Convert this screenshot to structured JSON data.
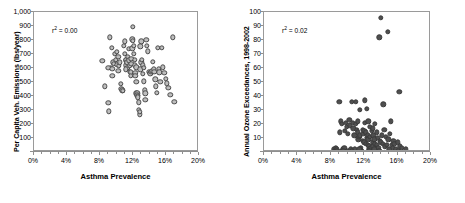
{
  "figure": {
    "background": "#ffffff",
    "frame_color": "#9a9a9a"
  },
  "chart_data": [
    {
      "type": "scatter",
      "panel": "left",
      "title": "",
      "xlabel": "Asthma Prevalence",
      "ylabel": "Per Capita Veh. Emissions (lbs/year)",
      "annotation": "r² = 0.00",
      "r_squared": 0.0,
      "marker_style": "open-circle",
      "marker_fill": "#bdbdbd",
      "marker_edge": "#4a4a4a",
      "grid": false,
      "legend": "none",
      "xlim": [
        0,
        20
      ],
      "ylim": [
        0,
        1000
      ],
      "xticks": [
        0,
        4,
        8,
        12,
        16,
        20
      ],
      "xticklabels": [
        "0%",
        "4%",
        "8%",
        "12%",
        "16%",
        "20%"
      ],
      "yticks": [
        100,
        200,
        300,
        400,
        500,
        600,
        700,
        800,
        900,
        1000
      ],
      "yticklabels": [
        "100",
        "200",
        "300",
        "400",
        "500",
        "600",
        "700",
        "800",
        "900",
        "1,000"
      ],
      "x": [
        8.3,
        8.6,
        9.0,
        9.1,
        9.2,
        9.3,
        9.4,
        9.5,
        9.6,
        9.7,
        9.8,
        9.9,
        10.0,
        10.1,
        10.2,
        10.3,
        10.4,
        10.5,
        10.6,
        10.7,
        10.8,
        10.9,
        11.0,
        11.0,
        11.1,
        11.2,
        11.2,
        11.3,
        11.3,
        11.4,
        11.5,
        11.5,
        11.6,
        11.6,
        11.7,
        11.7,
        11.8,
        11.8,
        11.9,
        11.9,
        12.0,
        12.0,
        12.1,
        12.1,
        12.2,
        12.2,
        12.3,
        12.3,
        12.4,
        12.4,
        12.5,
        12.5,
        12.6,
        12.6,
        12.7,
        12.7,
        12.8,
        12.8,
        12.9,
        13.0,
        13.0,
        13.1,
        13.2,
        13.2,
        13.3,
        13.4,
        13.5,
        13.5,
        13.6,
        13.7,
        13.8,
        13.9,
        14.0,
        14.1,
        14.2,
        14.3,
        14.4,
        14.5,
        14.6,
        14.7,
        14.8,
        14.9,
        15.0,
        15.1,
        15.2,
        15.3,
        15.5,
        15.6,
        15.8,
        16.0,
        16.1,
        16.3,
        16.5,
        16.8,
        17.0,
        9.0,
        9.5,
        10.2,
        11.1,
        12.4,
        12.9,
        13.3
      ],
      "y": [
        650,
        470,
        350,
        290,
        820,
        600,
        745,
        545,
        640,
        630,
        700,
        660,
        715,
        625,
        680,
        615,
        640,
        485,
        450,
        440,
        435,
        760,
        790,
        700,
        655,
        660,
        620,
        640,
        600,
        680,
        735,
        655,
        620,
        575,
        570,
        545,
        665,
        630,
        805,
        740,
        895,
        795,
        760,
        700,
        660,
        620,
        565,
        545,
        500,
        420,
        420,
        405,
        400,
        390,
        355,
        300,
        270,
        285,
        755,
        790,
        640,
        660,
        620,
        560,
        505,
        440,
        420,
        375,
        800,
        760,
        720,
        575,
        565,
        560,
        575,
        580,
        645,
        590,
        575,
        520,
        470,
        425,
        745,
        595,
        570,
        500,
        745,
        605,
        565,
        525,
        490,
        460,
        410,
        820,
        360,
        600,
        595,
        580,
        590,
        605,
        590,
        600
      ]
    },
    {
      "type": "scatter",
      "panel": "right",
      "title": "",
      "xlabel": "Asthma Prevalence",
      "ylabel": "Annual Ozone Exceedances, 1998-2002",
      "annotation": "r² = 0.02",
      "r_squared": 0.02,
      "marker_style": "filled-circle",
      "marker_fill": "#4f4f4f",
      "marker_edge": "#3a3a3a",
      "grid": false,
      "legend": "none",
      "xlim": [
        0,
        20
      ],
      "ylim": [
        0,
        100
      ],
      "xticks": [
        0,
        4,
        8,
        12,
        16,
        20
      ],
      "xticklabels": [
        "0%",
        "4%",
        "8%",
        "12%",
        "16%",
        "20%"
      ],
      "yticks": [
        10,
        20,
        30,
        40,
        50,
        60,
        70,
        80,
        90,
        100
      ],
      "yticklabels": [
        "10",
        "20",
        "30",
        "40",
        "50",
        "60",
        "70",
        "80",
        "90",
        "100"
      ],
      "x": [
        8.4,
        8.5,
        8.6,
        8.7,
        8.8,
        9.0,
        9.1,
        9.2,
        9.3,
        9.4,
        9.5,
        9.6,
        9.7,
        9.8,
        9.9,
        10.0,
        10.1,
        10.2,
        10.3,
        10.4,
        10.5,
        10.6,
        10.7,
        10.8,
        10.9,
        11.0,
        11.0,
        11.1,
        11.2,
        11.2,
        11.3,
        11.4,
        11.5,
        11.5,
        11.6,
        11.7,
        11.8,
        11.8,
        11.9,
        12.0,
        12.0,
        12.1,
        12.1,
        12.2,
        12.2,
        12.3,
        12.3,
        12.4,
        12.4,
        12.5,
        12.5,
        12.6,
        12.6,
        12.7,
        12.7,
        12.8,
        12.9,
        13.0,
        13.0,
        13.1,
        13.1,
        13.2,
        13.3,
        13.3,
        13.4,
        13.5,
        13.5,
        13.6,
        13.7,
        13.8,
        13.9,
        14.0,
        14.0,
        14.1,
        14.2,
        14.3,
        14.4,
        14.5,
        14.6,
        14.7,
        14.8,
        14.9,
        15.0,
        15.1,
        15.2,
        15.3,
        15.4,
        15.5,
        15.6,
        15.8,
        16.0,
        16.1,
        16.2,
        16.3,
        16.5,
        17.0,
        9.5,
        10.5,
        11.4,
        12.6,
        13.2,
        13.8
      ],
      "y": [
        2,
        1,
        3,
        2,
        1,
        36,
        14,
        22,
        20,
        1,
        2,
        3,
        15,
        21,
        18,
        13,
        1,
        23,
        19,
        2,
        36,
        21,
        17,
        12,
        2,
        36,
        20,
        16,
        22,
        14,
        9,
        11,
        30,
        12,
        3,
        1,
        16,
        8,
        13,
        15,
        7,
        37,
        21,
        14,
        6,
        31,
        10,
        12,
        5,
        22,
        9,
        4,
        2,
        18,
        11,
        3,
        15,
        17,
        7,
        12,
        4,
        9,
        20,
        6,
        2,
        14,
        5,
        10,
        3,
        82,
        8,
        96,
        7,
        12,
        6,
        34,
        16,
        4,
        11,
        5,
        86,
        9,
        2,
        13,
        22,
        5,
        3,
        8,
        6,
        2,
        7,
        1,
        43,
        4,
        3,
        2,
        1,
        1,
        2,
        1,
        2,
        1
      ]
    }
  ]
}
